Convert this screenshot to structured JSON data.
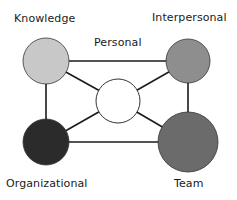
{
  "diagram": {
    "title": "",
    "nodes": [
      {
        "id": "knowledge",
        "label": "Knowledge",
        "cx": 46,
        "cy": 61,
        "r": 23,
        "fill": "#c8c8c8"
      },
      {
        "id": "interpersonal",
        "label": "Interpersonal",
        "cx": 188,
        "cy": 61,
        "r": 22,
        "fill": "#8e8e8e"
      },
      {
        "id": "organizational",
        "label": "Organizational",
        "cx": 46,
        "cy": 142,
        "r": 23,
        "fill": "#2b2b2b"
      },
      {
        "id": "team",
        "label": "Team",
        "cx": 188,
        "cy": 142,
        "r": 30,
        "fill": "#6b6b6b"
      },
      {
        "id": "personal",
        "label": "Personal",
        "cx": 118,
        "cy": 101,
        "r": 22,
        "fill": "#ffffff"
      }
    ],
    "edges": [
      {
        "from": "knowledge",
        "to": "interpersonal"
      },
      {
        "from": "organizational",
        "to": "team"
      },
      {
        "from": "knowledge",
        "to": "organizational"
      },
      {
        "from": "interpersonal",
        "to": "team"
      },
      {
        "from": "knowledge",
        "to": "personal"
      },
      {
        "from": "interpersonal",
        "to": "personal"
      },
      {
        "from": "organizational",
        "to": "personal"
      },
      {
        "from": "team",
        "to": "personal"
      }
    ],
    "colors": {
      "edge": "#1a1a1a",
      "outline": "#333333"
    }
  }
}
